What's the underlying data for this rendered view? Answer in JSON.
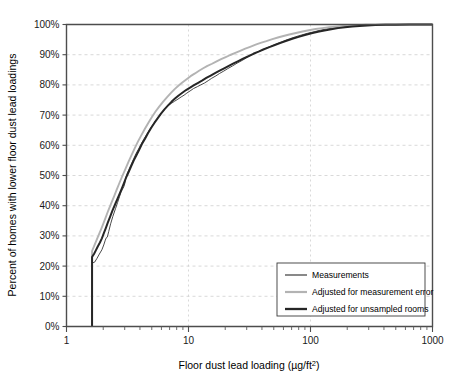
{
  "chart_data": {
    "type": "line",
    "title": "",
    "xlabel": "Floor dust lead loading (µg/ft²)",
    "ylabel": "Percent of homes with lower floor dust lead loadings",
    "xscale": "log",
    "xlim": [
      1,
      1000
    ],
    "ylim": [
      0,
      100
    ],
    "grid": true,
    "legend_position": "bottom-right-inside",
    "xtick_labels": [
      "1",
      "10",
      "100",
      "1000"
    ],
    "xtick_values": [
      1,
      10,
      100,
      1000
    ],
    "xminor_values": [
      2,
      3,
      4,
      5,
      6,
      7,
      8,
      9,
      20,
      30,
      40,
      50,
      60,
      70,
      80,
      90,
      200,
      300,
      400,
      500,
      600,
      700,
      800,
      900
    ],
    "ytick_labels": [
      "0%",
      "10%",
      "20%",
      "30%",
      "40%",
      "50%",
      "60%",
      "70%",
      "80%",
      "90%",
      "100%"
    ],
    "ytick_values": [
      0,
      10,
      20,
      30,
      40,
      50,
      60,
      70,
      80,
      90,
      100
    ],
    "series": [
      {
        "name": "Measurements",
        "color": "#4a4a4a",
        "width": 1.0,
        "points": [
          [
            1.62,
            0
          ],
          [
            1.62,
            21.0
          ],
          [
            1.7,
            21.3
          ],
          [
            1.78,
            22.6
          ],
          [
            1.86,
            24.0
          ],
          [
            1.95,
            25.4
          ],
          [
            2.02,
            27.0
          ],
          [
            2.08,
            28.6
          ],
          [
            2.12,
            29.4
          ],
          [
            2.16,
            29.6
          ],
          [
            2.22,
            31.5
          ],
          [
            2.3,
            34.0
          ],
          [
            2.4,
            36.5
          ],
          [
            2.52,
            39.0
          ],
          [
            2.62,
            41.0
          ],
          [
            2.72,
            43.0
          ],
          [
            2.8,
            44.5
          ],
          [
            2.88,
            45.5
          ],
          [
            2.95,
            46.3
          ],
          [
            3.0,
            47.2
          ],
          [
            3.05,
            48.8
          ],
          [
            3.12,
            50.3
          ],
          [
            3.25,
            52.0
          ],
          [
            3.4,
            53.8
          ],
          [
            3.55,
            55.5
          ],
          [
            3.72,
            57.3
          ],
          [
            3.9,
            58.8
          ],
          [
            4.1,
            60.5
          ],
          [
            4.3,
            62.0
          ],
          [
            4.55,
            63.6
          ],
          [
            4.8,
            65.2
          ],
          [
            5.1,
            66.8
          ],
          [
            5.4,
            68.2
          ],
          [
            5.75,
            69.6
          ],
          [
            6.1,
            71.0
          ],
          [
            6.5,
            72.3
          ],
          [
            6.9,
            73.3
          ],
          [
            7.3,
            74.0
          ],
          [
            7.7,
            74.6
          ],
          [
            8.2,
            75.3
          ],
          [
            8.7,
            76.0
          ],
          [
            9.2,
            76.6
          ],
          [
            9.7,
            77.3
          ],
          [
            10.3,
            78.0
          ],
          [
            11.0,
            78.8
          ],
          [
            11.8,
            79.4
          ],
          [
            12.6,
            80.0
          ],
          [
            13.5,
            80.6
          ],
          [
            14.5,
            81.4
          ],
          [
            15.5,
            82.2
          ],
          [
            16.8,
            83.0
          ],
          [
            18.0,
            83.8
          ],
          [
            19.5,
            84.6
          ],
          [
            21.0,
            85.4
          ],
          [
            23.0,
            86.3
          ],
          [
            25.0,
            87.2
          ],
          [
            27.5,
            88.1
          ],
          [
            30.0,
            89.0
          ],
          [
            33.0,
            89.9
          ],
          [
            36.0,
            90.7
          ],
          [
            40.0,
            91.5
          ],
          [
            44.0,
            92.3
          ],
          [
            49.0,
            93.0
          ],
          [
            54.0,
            93.8
          ],
          [
            60.0,
            94.5
          ],
          [
            67.0,
            95.2
          ],
          [
            75.0,
            95.9
          ],
          [
            84.0,
            96.5
          ],
          [
            95.0,
            97.1
          ],
          [
            107.0,
            97.6
          ],
          [
            120.0,
            98.1
          ],
          [
            135.0,
            98.5
          ],
          [
            152.0,
            98.8
          ],
          [
            172.0,
            99.1
          ],
          [
            195.0,
            99.3
          ],
          [
            220.0,
            99.5
          ],
          [
            250.0,
            99.7
          ],
          [
            290.0,
            99.8
          ],
          [
            340.0,
            99.9
          ],
          [
            420.0,
            99.95
          ],
          [
            550.0,
            100
          ],
          [
            750.0,
            100
          ],
          [
            1000.0,
            100
          ]
        ]
      },
      {
        "name": "Adjusted for measurement error",
        "color": "#b3b3b3",
        "width": 1.9,
        "points": [
          [
            1.62,
            0
          ],
          [
            1.62,
            25.0
          ],
          [
            1.68,
            26.5
          ],
          [
            1.75,
            28.3
          ],
          [
            1.83,
            30.2
          ],
          [
            1.92,
            32.2
          ],
          [
            2.0,
            34.0
          ],
          [
            2.1,
            36.2
          ],
          [
            2.2,
            38.4
          ],
          [
            2.32,
            40.7
          ],
          [
            2.45,
            43.0
          ],
          [
            2.58,
            45.3
          ],
          [
            2.72,
            47.6
          ],
          [
            2.88,
            50.0
          ],
          [
            3.05,
            52.3
          ],
          [
            3.22,
            54.5
          ],
          [
            3.42,
            56.8
          ],
          [
            3.62,
            59.0
          ],
          [
            3.85,
            61.2
          ],
          [
            4.1,
            63.3
          ],
          [
            4.38,
            65.4
          ],
          [
            4.68,
            67.4
          ],
          [
            5.0,
            69.3
          ],
          [
            5.35,
            71.1
          ],
          [
            5.75,
            72.8
          ],
          [
            6.18,
            74.4
          ],
          [
            6.65,
            75.9
          ],
          [
            7.15,
            77.3
          ],
          [
            7.7,
            78.6
          ],
          [
            8.3,
            79.8
          ],
          [
            8.95,
            80.9
          ],
          [
            9.65,
            81.9
          ],
          [
            10.4,
            82.9
          ],
          [
            11.3,
            83.8
          ],
          [
            12.2,
            84.7
          ],
          [
            13.2,
            85.5
          ],
          [
            14.3,
            86.3
          ],
          [
            15.6,
            87.0
          ],
          [
            17.0,
            87.8
          ],
          [
            18.5,
            88.5
          ],
          [
            20.2,
            89.2
          ],
          [
            22.0,
            89.9
          ],
          [
            24.2,
            90.6
          ],
          [
            26.5,
            91.3
          ],
          [
            29.2,
            92.0
          ],
          [
            32.0,
            92.6
          ],
          [
            35.5,
            93.3
          ],
          [
            39.0,
            93.9
          ],
          [
            43.5,
            94.5
          ],
          [
            48.0,
            95.1
          ],
          [
            54.0,
            95.7
          ],
          [
            60.0,
            96.2
          ],
          [
            67.0,
            96.7
          ],
          [
            76.0,
            97.2
          ],
          [
            86.0,
            97.7
          ],
          [
            97.0,
            98.1
          ],
          [
            110.0,
            98.5
          ],
          [
            125.0,
            98.8
          ],
          [
            142.0,
            99.1
          ],
          [
            162.0,
            99.3
          ],
          [
            185.0,
            99.5
          ],
          [
            212.0,
            99.7
          ],
          [
            245.0,
            99.8
          ],
          [
            285.0,
            99.9
          ],
          [
            340.0,
            99.95
          ],
          [
            420.0,
            100
          ],
          [
            560.0,
            100
          ],
          [
            760.0,
            100
          ],
          [
            1000.0,
            100
          ]
        ]
      },
      {
        "name": "Adjusted for unsampled rooms",
        "color": "#262626",
        "width": 2.0,
        "points": [
          [
            1.62,
            0
          ],
          [
            1.62,
            23.0
          ],
          [
            1.68,
            24.0
          ],
          [
            1.74,
            25.2
          ],
          [
            1.8,
            26.4
          ],
          [
            1.88,
            27.8
          ],
          [
            1.95,
            29.2
          ],
          [
            2.02,
            30.8
          ],
          [
            2.1,
            32.6
          ],
          [
            2.18,
            34.4
          ],
          [
            2.28,
            36.4
          ],
          [
            2.38,
            38.4
          ],
          [
            2.5,
            40.4
          ],
          [
            2.62,
            42.3
          ],
          [
            2.74,
            44.2
          ],
          [
            2.86,
            46.0
          ],
          [
            2.98,
            47.8
          ],
          [
            3.1,
            49.6
          ],
          [
            3.25,
            51.4
          ],
          [
            3.4,
            53.2
          ],
          [
            3.56,
            55.0
          ],
          [
            3.75,
            56.8
          ],
          [
            3.95,
            58.6
          ],
          [
            4.15,
            60.4
          ],
          [
            4.4,
            62.2
          ],
          [
            4.65,
            64.0
          ],
          [
            4.95,
            65.8
          ],
          [
            5.25,
            67.4
          ],
          [
            5.6,
            69.0
          ],
          [
            5.95,
            70.5
          ],
          [
            6.35,
            71.9
          ],
          [
            6.8,
            73.2
          ],
          [
            7.25,
            74.4
          ],
          [
            7.75,
            75.5
          ],
          [
            8.3,
            76.5
          ],
          [
            8.9,
            77.4
          ],
          [
            9.55,
            78.3
          ],
          [
            10.3,
            79.1
          ],
          [
            11.1,
            79.9
          ],
          [
            12.0,
            80.7
          ],
          [
            13.0,
            81.5
          ],
          [
            14.0,
            82.3
          ],
          [
            15.2,
            83.1
          ],
          [
            16.5,
            83.9
          ],
          [
            18.0,
            84.7
          ],
          [
            19.6,
            85.5
          ],
          [
            21.4,
            86.3
          ],
          [
            23.4,
            87.1
          ],
          [
            25.6,
            87.9
          ],
          [
            28.0,
            88.7
          ],
          [
            31.0,
            89.5
          ],
          [
            34.0,
            90.3
          ],
          [
            37.5,
            91.0
          ],
          [
            41.5,
            91.8
          ],
          [
            46.0,
            92.5
          ],
          [
            51.0,
            93.2
          ],
          [
            57.0,
            93.9
          ],
          [
            63.5,
            94.6
          ],
          [
            71.0,
            95.3
          ],
          [
            80.0,
            95.9
          ],
          [
            90.0,
            96.5
          ],
          [
            102.0,
            97.1
          ],
          [
            115.0,
            97.6
          ],
          [
            130.0,
            98.0
          ],
          [
            148.0,
            98.4
          ],
          [
            168.0,
            98.8
          ],
          [
            192.0,
            99.1
          ],
          [
            220.0,
            99.3
          ],
          [
            252.0,
            99.5
          ],
          [
            292.0,
            99.7
          ],
          [
            340.0,
            99.8
          ],
          [
            410.0,
            99.9
          ],
          [
            500.0,
            99.95
          ],
          [
            650.0,
            100
          ],
          [
            1000.0,
            100
          ]
        ]
      }
    ]
  },
  "legend": {
    "items": [
      {
        "label": "Measurements"
      },
      {
        "label": "Adjusted for measurement error"
      },
      {
        "label": "Adjusted for unsampled rooms"
      }
    ]
  }
}
